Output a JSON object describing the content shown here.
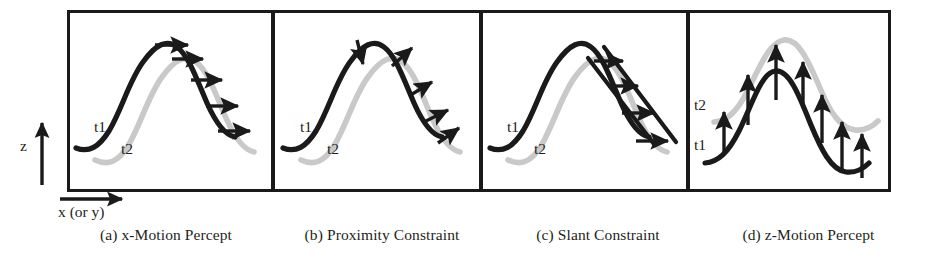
{
  "figure": {
    "type": "scientific-diagram",
    "background_color": "#ffffff",
    "ink_color": "#231f20",
    "t1_curve_color": "#1a1a1a",
    "t2_curve_color": "#c9c9c9",
    "axes": {
      "z_label": "z",
      "x_label": "x (or y)"
    },
    "panels": [
      {
        "id": "a",
        "caption": "(a) x-Motion Percept",
        "t1_label": "t1",
        "t2_label": "t2",
        "arrow_count": 5,
        "arrow_direction": "horizontal-right"
      },
      {
        "id": "b",
        "caption": "(b) Proximity Constraint",
        "t1_label": "t1",
        "t2_label": "t2",
        "arrow_count": 5,
        "arrow_direction": "curve-normal"
      },
      {
        "id": "c",
        "caption": "(c) Slant Constraint",
        "t1_label": "t1",
        "t2_label": "t2",
        "arrow_count": 4,
        "arrow_direction": "horizontal-right"
      },
      {
        "id": "d",
        "caption": "(d) z-Motion Percept",
        "t1_label": "t1",
        "t2_label": "t2",
        "arrow_count": 8,
        "arrow_direction": "vertical-up"
      }
    ]
  }
}
